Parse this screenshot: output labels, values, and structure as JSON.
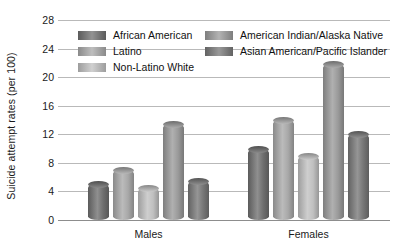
{
  "chart_data": {
    "type": "bar",
    "title": "",
    "xlabel": "",
    "ylabel": "Suicide attempt rates (per 100)",
    "categories": [
      "Males",
      "Females"
    ],
    "ylim": [
      0,
      28
    ],
    "yticks": [
      0,
      4,
      8,
      12,
      16,
      20,
      24,
      28
    ],
    "grid": true,
    "legend_position": "top-inside",
    "series": [
      {
        "name": "African American",
        "color": "#6f6f6f",
        "values": [
          5.0,
          10.0
        ]
      },
      {
        "name": "Latino",
        "color": "#a8a8a8",
        "values": [
          7.0,
          14.0
        ]
      },
      {
        "name": "Non-Latino White",
        "color": "#c0c0c0",
        "values": [
          4.5,
          9.0
        ]
      },
      {
        "name": "American Indian/Alaska Native",
        "color": "#9a9a9a",
        "values": [
          13.5,
          21.8
        ]
      },
      {
        "name": "Asian American/Pacific Islander",
        "color": "#777777",
        "values": [
          5.5,
          12.0
        ]
      }
    ]
  },
  "axis": {
    "y_title": "Suicide attempt rates (per 100)",
    "y_tick_labels": [
      "0",
      "4",
      "8",
      "12",
      "16",
      "20",
      "24",
      "28"
    ],
    "x_tick_labels": [
      "Males",
      "Females"
    ]
  },
  "legend": {
    "column_left": [
      {
        "label": "African American"
      },
      {
        "label": "Latino"
      },
      {
        "label": "Non-Latino White"
      }
    ],
    "column_right": [
      {
        "label": "American Indian/Alaska Native"
      },
      {
        "label": "Asian American/Pacific Islander"
      }
    ]
  },
  "colors": {
    "gridline": "#b9b9b9",
    "baseline": "#8d8d8d",
    "text": "#1a1a1a",
    "background": "#ffffff"
  }
}
